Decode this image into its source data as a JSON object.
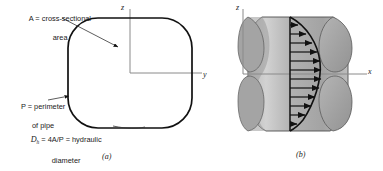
{
  "figure": {
    "panel_a": {
      "caption": "(a)",
      "labels": {
        "area_line1": "A = cross-sectional",
        "area_line2": "area",
        "perimeter_line1": "P = perimeter",
        "perimeter_line2": "of pipe",
        "dh_var": "D",
        "dh_sub": "h",
        "dh_rest": " = 4A/P = hydraulic",
        "dh_line2": "diameter"
      },
      "axes": {
        "vertical": "z",
        "horizontal": "y"
      },
      "shape": "rounded-square-cross-section"
    },
    "panel_b": {
      "caption": "(b)",
      "labels": {
        "velocity": "V = u(y,z)"
      },
      "axes": {
        "vertical": "z",
        "horizontal": "x"
      },
      "arrow_count": 12,
      "profile": "parabolic-velocity-profile"
    },
    "colors": {
      "ink": "#1a1a1a",
      "duct_fill": "#a8a8a8",
      "duct_fill_light": "#c6c6c6",
      "duct_shadow": "#8f8f8f",
      "axis": "#7a7a7a",
      "background": "#ffffff"
    }
  }
}
